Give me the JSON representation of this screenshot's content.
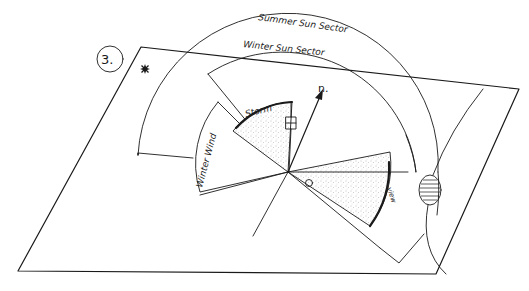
{
  "figure": {
    "number_label": "3.",
    "north_label": "n.",
    "labels": {
      "summer_sun_sector": "Summer Sun Sector",
      "winter_sun_sector": "Winter Sun Sector",
      "winter_wind": "Winter Wind",
      "storm": "Storm",
      "view": "view"
    },
    "symbols": {
      "star": "star-marker",
      "building": "small-rectangle-building",
      "observer": "observer-circle",
      "pond": "striped-oval-pond"
    },
    "colors": {
      "ink": "#1a1a1a",
      "background": "#ffffff",
      "stipple": "#888888"
    }
  }
}
